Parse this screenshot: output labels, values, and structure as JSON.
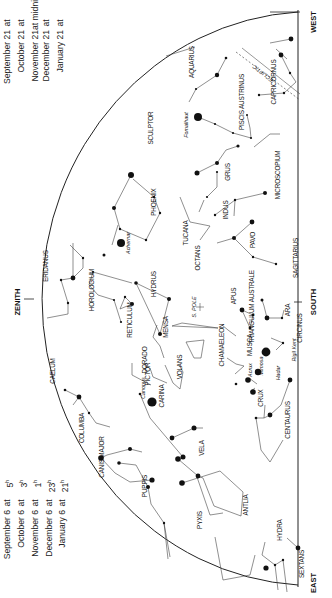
{
  "chart": {
    "orientation": "rotated -90deg",
    "directions": {
      "zenith": "ZENITH",
      "south": "SOUTH",
      "east": "EAST",
      "west": "WEST"
    },
    "pole_label": "S. POLE",
    "ecliptic_label": "ECLIPTIC",
    "ecliptic_markers": [
      "Saturn",
      "Jupiter"
    ],
    "times_left": [
      {
        "date": "September 6",
        "at": "at",
        "hour": "5",
        "suffix": "h"
      },
      {
        "date": "October 6",
        "at": "at",
        "hour": "3",
        "suffix": "h"
      },
      {
        "date": "November 6",
        "at": "at",
        "hour": "1",
        "suffix": "h"
      },
      {
        "date": "December 6",
        "at": "at",
        "hour": "23",
        "suffix": "h"
      },
      {
        "date": "January 6",
        "at": "at",
        "hour": "21",
        "suffix": "h"
      }
    ],
    "times_right": [
      {
        "date": "September 21",
        "at": "at",
        "hour": "4",
        "suffix": "h"
      },
      {
        "date": "October 21",
        "at": "at",
        "hour": "2",
        "suffix": "h"
      },
      {
        "date": "November 21",
        "at": "at midnight",
        "hour": "",
        "suffix": ""
      },
      {
        "date": "December 21",
        "at": "at",
        "hour": "22",
        "suffix": "h"
      },
      {
        "date": "January 21",
        "at": "at",
        "hour": "20",
        "suffix": "h"
      }
    ],
    "constellations": [
      "AQUARIUS",
      "PISCIS AUSTRINUS",
      "CAPRICORNUS",
      "SCULPTOR",
      "GRUS",
      "MICROSCOPIUM",
      "PHOENIX",
      "TUCANA",
      "INDUS",
      "PAVO",
      "SAGITTARIUS",
      "ERIDANUS",
      "HOROLOGIUM",
      "RETICULUM",
      "HYDRUS",
      "OCTANS",
      "APUS",
      "TRIANGULUM AUSTRALE",
      "ARA",
      "CIRCINUS",
      "CAELUM",
      "MENSA",
      "DORADO",
      "CHAMAELEON",
      "MUSCA",
      "PICTOR",
      "VOLANS",
      "CARINA",
      "CRUX",
      "CENTAURUS",
      "COLUMBA",
      "CANIS MAJOR",
      "VELA",
      "PUPPIS",
      "ANTLIA",
      "PYXIS",
      "HYDRA",
      "SEXTANS"
    ],
    "stars": [
      "Fomalhaut",
      "Achernar",
      "Canopus",
      "Acrux",
      "Mimosa",
      "Hadar",
      "Rigil Kent"
    ]
  }
}
